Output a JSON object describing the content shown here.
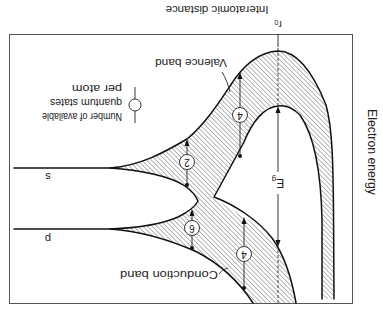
{
  "figure": {
    "x_axis_label": "Interatomic distance",
    "y_axis_label": "Electron energy",
    "equilibrium_spacing": {
      "symbol": "r",
      "subscript": "0"
    },
    "band_labels": {
      "valence": "Valence band",
      "conduction": "Conduction band"
    },
    "atomic_levels": {
      "s": "s",
      "p": "p"
    },
    "band_gap": {
      "symbol": "E",
      "subscript": "g"
    },
    "legend": {
      "lines": [
        "Number of available",
        "quantum states",
        "per atom"
      ]
    },
    "states_per_atom": {
      "valence": "4",
      "s": "2",
      "p": "6",
      "conduction": "4"
    },
    "colors": {
      "line": "#111111",
      "hatch": "#555555",
      "frame": "#555555",
      "text": "#222222",
      "background": "#ffffff"
    }
  }
}
